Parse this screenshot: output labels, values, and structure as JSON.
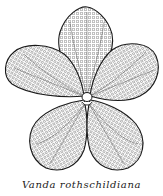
{
  "figure": {
    "petal_count": 5,
    "style": "stippled line drawing with tessellated petal pattern",
    "colors": {
      "ink": "#1a1a1a",
      "paper": "#ffffff",
      "stipple": "#6a6a6a"
    }
  },
  "caption": {
    "text": "Vanda  rothschildiana"
  }
}
